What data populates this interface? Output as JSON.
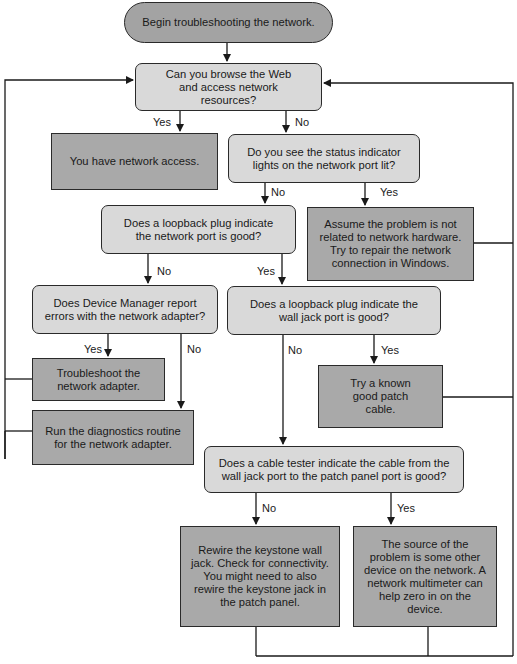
{
  "colors": {
    "decision_fill": "#d9d9d9",
    "action_fill": "#a9a9a9",
    "terminal_fill": "#a3a3a3",
    "line": "#1a1a1a",
    "background": "#ffffff"
  },
  "nodes": {
    "start": {
      "type": "terminal",
      "text": "Begin troubleshooting the network."
    },
    "q_browse": {
      "type": "decision",
      "text": "Can you browse the Web and access network resources?"
    },
    "a_have_access": {
      "type": "action",
      "text": "You have network access."
    },
    "q_status_lights": {
      "type": "decision",
      "text": "Do you see the status indicator lights on the network port lit?"
    },
    "q_loopback_port": {
      "type": "decision",
      "text": "Does a loopback plug indicate the network port is good?"
    },
    "a_repair_windows": {
      "type": "action",
      "text": "Assume the problem is not related to network hardware. Try to repair the network connection in Windows."
    },
    "q_device_manager": {
      "type": "decision",
      "text": "Does Device Manager report errors with the network adapter?"
    },
    "q_loopback_wall": {
      "type": "decision",
      "text": "Does a loopback plug indicate the wall jack port is good?"
    },
    "a_troubleshoot_adapter": {
      "type": "action",
      "text": "Troubleshoot the network adapter."
    },
    "a_patch_cable": {
      "type": "action",
      "text": "Try a known good patch cable."
    },
    "a_diagnostics": {
      "type": "action",
      "text": "Run the diagnostics routine for the network adapter."
    },
    "q_cable_tester": {
      "type": "decision",
      "text": "Does a cable tester indicate the cable from the wall jack port to the patch panel port is good?"
    },
    "a_rewire": {
      "type": "action",
      "text": "Rewire the keystone wall jack. Check for connectivity. You might need to also rewire the keystone jack in the patch panel."
    },
    "a_other_device": {
      "type": "action",
      "text": "The source of the problem is some other device on the network. A network multimeter can help zero in on the device."
    }
  },
  "edge_labels": {
    "browse_yes": "Yes",
    "browse_no": "No",
    "status_no": "No",
    "status_yes": "Yes",
    "loopback_port_no": "No",
    "loopback_port_yes": "Yes",
    "device_manager_yes": "Yes",
    "device_manager_no": "No",
    "loopback_wall_no": "No",
    "loopback_wall_yes": "Yes",
    "cable_tester_no": "No",
    "cable_tester_yes": "Yes"
  },
  "edges": [
    {
      "from": "start",
      "to": "q_browse"
    },
    {
      "from": "q_browse",
      "to": "a_have_access",
      "label": "Yes"
    },
    {
      "from": "q_browse",
      "to": "q_status_lights",
      "label": "No"
    },
    {
      "from": "q_status_lights",
      "to": "q_loopback_port",
      "label": "No"
    },
    {
      "from": "q_status_lights",
      "to": "a_repair_windows",
      "label": "Yes"
    },
    {
      "from": "q_loopback_port",
      "to": "q_device_manager",
      "label": "No"
    },
    {
      "from": "q_loopback_port",
      "to": "q_loopback_wall",
      "label": "Yes"
    },
    {
      "from": "q_device_manager",
      "to": "a_troubleshoot_adapter",
      "label": "Yes"
    },
    {
      "from": "q_device_manager",
      "to": "a_diagnostics",
      "label": "No"
    },
    {
      "from": "q_loopback_wall",
      "to": "q_cable_tester",
      "label": "No"
    },
    {
      "from": "q_loopback_wall",
      "to": "a_patch_cable",
      "label": "Yes"
    },
    {
      "from": "q_cable_tester",
      "to": "a_rewire",
      "label": "No"
    },
    {
      "from": "q_cable_tester",
      "to": "a_other_device",
      "label": "Yes"
    },
    {
      "from": "a_troubleshoot_adapter",
      "to": "q_browse"
    },
    {
      "from": "a_diagnostics",
      "to": "q_browse"
    },
    {
      "from": "a_repair_windows",
      "to": "q_browse"
    },
    {
      "from": "a_patch_cable",
      "to": "q_browse"
    },
    {
      "from": "a_rewire",
      "to": "q_browse"
    },
    {
      "from": "a_other_device",
      "to": "q_browse"
    }
  ]
}
